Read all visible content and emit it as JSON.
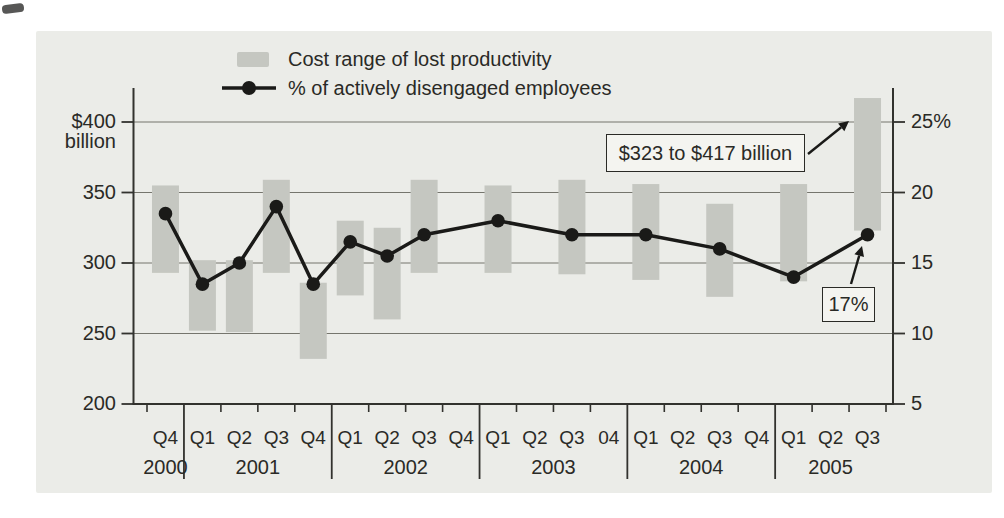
{
  "colors": {
    "page_bg": "#ffffff",
    "panel_bg": "#ebece8",
    "bar_fill": "#c5c7c1",
    "line": "#1a1a18",
    "gridline": "#75756d",
    "axis": "#32322e",
    "text": "#2a2a26",
    "annotation_box_bg": "#f4f4f0"
  },
  "chart_data": {
    "type": "combo",
    "subtypes": [
      "range-bar",
      "line"
    ],
    "title": "",
    "legend": [
      {
        "label": "Cost range of lost productivity",
        "swatch": "gray-bar"
      },
      {
        "label": "% of actively disengaged employees",
        "swatch": "line-dot"
      }
    ],
    "left_axis": {
      "ticks": [
        400,
        350,
        300,
        250,
        200
      ],
      "tick_labels": [
        "$400",
        "350",
        "300",
        "250",
        "200"
      ],
      "unit_label": "billion",
      "unit": "$ billion",
      "range": [
        200,
        425
      ]
    },
    "right_axis": {
      "ticks": [
        25,
        20,
        15,
        10,
        5
      ],
      "tick_labels": [
        "25%",
        "20",
        "15",
        "10",
        "5"
      ],
      "unit": "%",
      "range": [
        5,
        27
      ]
    },
    "gridlines": [
      250,
      300,
      350,
      400
    ],
    "quarters": [
      "Q4",
      "Q1",
      "Q2",
      "Q3",
      "Q4",
      "Q1",
      "Q2",
      "Q3",
      "Q4",
      "Q1",
      "Q2",
      "Q3",
      "04",
      "Q1",
      "Q2",
      "Q3",
      "Q4",
      "Q1",
      "Q2",
      "Q3"
    ],
    "years": [
      {
        "label": "2000",
        "quarters": 1
      },
      {
        "label": "2001",
        "quarters": 4
      },
      {
        "label": "2002",
        "quarters": 4
      },
      {
        "label": "2003",
        "quarters": 4
      },
      {
        "label": "2004",
        "quarters": 4
      },
      {
        "label": "2005",
        "quarters": 3
      }
    ],
    "points": [
      {
        "label": "Q4 2000",
        "slot": 0,
        "cost_range": [
          293,
          355
        ],
        "pct": 18.5
      },
      {
        "label": "Q1 2001",
        "slot": 1,
        "cost_range": [
          252,
          302
        ],
        "pct": 13.5
      },
      {
        "label": "Q2 2001",
        "slot": 2,
        "cost_range": [
          251,
          302
        ],
        "pct": 15
      },
      {
        "label": "Q3 2001",
        "slot": 3,
        "cost_range": [
          293,
          359
        ],
        "pct": 19
      },
      {
        "label": "Q4 2001",
        "slot": 4,
        "cost_range": [
          232,
          286
        ],
        "pct": 13.5
      },
      {
        "label": "Q1 2002",
        "slot": 5,
        "cost_range": [
          277,
          330
        ],
        "pct": 16.5
      },
      {
        "label": "Q2 2002",
        "slot": 6,
        "cost_range": [
          260,
          325
        ],
        "pct": 15.5
      },
      {
        "label": "Q3 2002",
        "slot": 7,
        "cost_range": [
          293,
          359
        ],
        "pct": 17
      },
      {
        "label": "Q1 2003",
        "slot": 9,
        "cost_range": [
          293,
          355
        ],
        "pct": 18
      },
      {
        "label": "Q3 2003",
        "slot": 11,
        "cost_range": [
          292,
          359
        ],
        "pct": 17
      },
      {
        "label": "Q1 2004",
        "slot": 13,
        "cost_range": [
          288,
          356
        ],
        "pct": 17
      },
      {
        "label": "Q3 2004",
        "slot": 15,
        "cost_range": [
          276,
          342
        ],
        "pct": 16
      },
      {
        "label": "Q1 2005",
        "slot": 17,
        "cost_range": [
          287,
          356
        ],
        "pct": 14
      },
      {
        "label": "Q3 2005",
        "slot": 19,
        "cost_range": [
          323,
          417
        ],
        "pct": 17
      }
    ],
    "annotations": [
      {
        "text": "$323 to $417 billion",
        "points_to": "Q3 2005 cost bar"
      },
      {
        "text": "17%",
        "points_to": "Q3 2005 pct point"
      }
    ]
  }
}
